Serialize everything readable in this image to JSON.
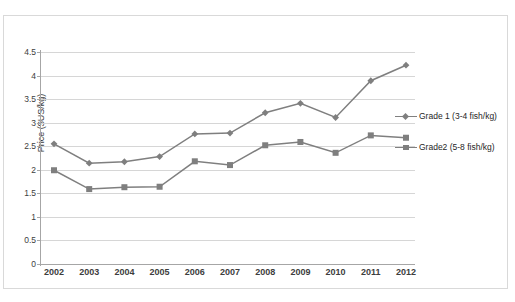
{
  "chart_data": {
    "type": "line",
    "title": "",
    "subtitle": "",
    "xlabel": "",
    "ylabel": "Price ($US/kg)",
    "categories": [
      "2002",
      "2003",
      "2004",
      "2005",
      "2006",
      "2007",
      "2008",
      "2009",
      "2010",
      "2011",
      "2012"
    ],
    "ylim": [
      0,
      4.5
    ],
    "yticks": [
      "0",
      "0.5",
      "1",
      "1.5",
      "2",
      "2.5",
      "3",
      "3.5",
      "4",
      "4.5"
    ],
    "ytick_values": [
      0,
      0.5,
      1,
      1.5,
      2,
      2.5,
      3,
      3.5,
      4,
      4.5
    ],
    "grid": "horizontal",
    "legend_position": "right",
    "series": [
      {
        "name": "Grade 1 (3-4 fish/kg)",
        "marker": "diamond",
        "color": "#7f7f7f",
        "values": [
          2.55,
          2.14,
          2.17,
          2.28,
          2.76,
          2.78,
          3.21,
          3.41,
          3.11,
          3.89,
          4.22
        ]
      },
      {
        "name": "Grade2 (5-8 fish/kg)",
        "marker": "square",
        "color": "#7f7f7f",
        "values": [
          1.99,
          1.59,
          1.63,
          1.64,
          2.18,
          2.1,
          2.52,
          2.59,
          2.36,
          2.73,
          2.68
        ]
      }
    ]
  },
  "axis": {
    "y_title": "Price ($US/kg)"
  },
  "legend": {
    "items": [
      {
        "label": "Grade 1 (3-4 fish/kg)"
      },
      {
        "label": "Grade2 (5-8 fish/kg)"
      }
    ]
  },
  "colors": {
    "series_line": "#808080",
    "marker": "#7f7f7f",
    "gridline": "#d6d6d6",
    "axis": "#a6a6a6",
    "text": "#3d3d3d",
    "frame": "#d9d9d9",
    "background": "#ffffff"
  },
  "artifact": {
    "text": ""
  }
}
